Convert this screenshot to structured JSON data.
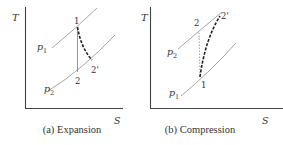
{
  "figure": {
    "panels": [
      {
        "id": "a",
        "caption": "(a) Expansion",
        "y_axis_label": "T",
        "x_axis_label": "S",
        "isobars": [
          {
            "label": "p",
            "subscript": "1",
            "role": "high pressure"
          },
          {
            "label": "p",
            "subscript": "2",
            "role": "low pressure"
          }
        ],
        "points": {
          "start": "1",
          "isentropic_end": "2",
          "actual_end": "2'"
        },
        "processes": [
          {
            "from": "1",
            "to": "2",
            "style": "solid",
            "meaning": "isentropic"
          },
          {
            "from": "1",
            "to": "2'",
            "style": "dashed",
            "meaning": "actual"
          }
        ]
      },
      {
        "id": "b",
        "caption": "(b) Compression",
        "y_axis_label": "T",
        "x_axis_label": "S",
        "isobars": [
          {
            "label": "p",
            "subscript": "2",
            "role": "high pressure"
          },
          {
            "label": "p",
            "subscript": "1",
            "role": "low pressure"
          }
        ],
        "points": {
          "start": "1",
          "isentropic_end": "2",
          "actual_end": "2'"
        },
        "processes": [
          {
            "from": "1",
            "to": "2",
            "style": "dotted",
            "meaning": "isentropic"
          },
          {
            "from": "1",
            "to": "2'",
            "style": "dashed",
            "meaning": "actual"
          }
        ]
      }
    ],
    "colors": {
      "axis": "#444444",
      "isobar": "#9a9a9a",
      "process": "#222222",
      "text": "#333333"
    }
  }
}
